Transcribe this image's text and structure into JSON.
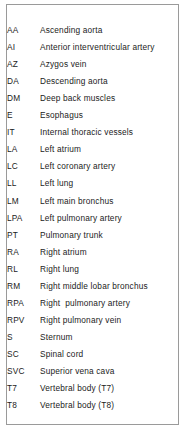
{
  "legend": {
    "title": "Anatomical structure abbreviations",
    "border_color": "#9a9a9a",
    "text_color": "#1b1b1b",
    "background_color": "#ffffff",
    "columns": [
      "Abbreviation",
      "Structure"
    ],
    "entries": [
      {
        "abbr": "AA",
        "desc": "Ascending aorta"
      },
      {
        "abbr": "AI",
        "desc": "Anterior interventricular artery"
      },
      {
        "abbr": "AZ",
        "desc": "Azygos vein"
      },
      {
        "abbr": "DA",
        "desc": "Descending aorta"
      },
      {
        "abbr": "DM",
        "desc": "Deep back muscles"
      },
      {
        "abbr": "E",
        "desc": "Esophagus"
      },
      {
        "abbr": "IT",
        "desc": "Internal thoracic vessels"
      },
      {
        "abbr": "LA",
        "desc": "Left atrium"
      },
      {
        "abbr": "LC",
        "desc": "Left coronary artery"
      },
      {
        "abbr": "LL",
        "desc": "Left lung"
      },
      {
        "abbr": "LM",
        "desc": "Left main bronchus"
      },
      {
        "abbr": "LPA",
        "desc": "Left pulmonary artery"
      },
      {
        "abbr": "PT",
        "desc": "Pulmonary trunk"
      },
      {
        "abbr": "RA",
        "desc": "Right atrium"
      },
      {
        "abbr": "RL",
        "desc": "Right lung"
      },
      {
        "abbr": "RM",
        "desc": "Right middle lobar bronchus"
      },
      {
        "abbr": "RPA",
        "desc": "Right  pulmonary artery"
      },
      {
        "abbr": "RPV",
        "desc": "Right pulmonary vein"
      },
      {
        "abbr": "S",
        "desc": "Sternum"
      },
      {
        "abbr": "SC",
        "desc": "Spinal cord"
      },
      {
        "abbr": "SVC",
        "desc": "Superior vena cava"
      },
      {
        "abbr": "T7",
        "desc": "Vertebral body (T7)"
      },
      {
        "abbr": "T8",
        "desc": "Vertebral body (T8)"
      }
    ]
  }
}
